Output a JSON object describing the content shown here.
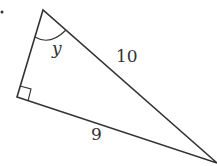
{
  "diagram": {
    "type": "right-triangle",
    "labels": {
      "angle": "y",
      "hypotenuse": "10",
      "leg": "9"
    },
    "colors": {
      "stroke": "#333333",
      "background": "#ffffff"
    }
  }
}
